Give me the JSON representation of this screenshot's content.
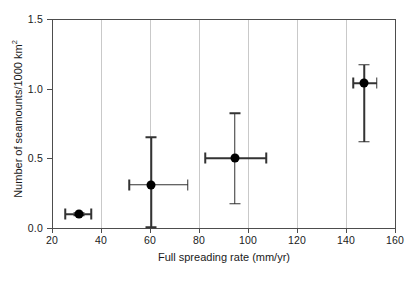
{
  "chart_data": {
    "type": "scatter",
    "title": "",
    "xlabel": "Full spreading rate (mm/yr)",
    "ylabel": "Number of seamounts/1000 km",
    "ylabel_superscript": "2",
    "xlim": [
      20,
      160
    ],
    "ylim": [
      0.0,
      1.5
    ],
    "xticks": [
      20,
      40,
      60,
      80,
      100,
      120,
      140,
      160
    ],
    "xticklabels": [
      "20",
      "40",
      "60",
      "80",
      "100",
      "120",
      "140",
      "160"
    ],
    "yticks": [
      0.0,
      0.5,
      1.0,
      1.5
    ],
    "yticklabels": [
      "0.0",
      "0.5",
      "1.0",
      "1.5"
    ],
    "grid": "vertical",
    "grid_color": "#c9c9c9",
    "marker_color": "#000000",
    "errorbar_color": "#333333",
    "axis_color": "#4d4d4d",
    "legend": "none",
    "points": [
      {
        "label": "point-1",
        "x": 31.0,
        "y": 0.1,
        "xerr_low": 25.5,
        "xerr_high": 36.0,
        "yerr_low": 0.09,
        "yerr_high": 0.11
      },
      {
        "label": "point-2",
        "x": 60.5,
        "y": 0.31,
        "xerr_low": 51.5,
        "xerr_high": 75.5,
        "yerr_low": 0.005,
        "yerr_high": 0.65
      },
      {
        "label": "point-3",
        "x": 94.5,
        "y": 0.5,
        "xerr_low": 82.5,
        "xerr_high": 107.5,
        "yerr_low": 0.175,
        "yerr_high": 0.825
      },
      {
        "label": "point-4",
        "x": 147.5,
        "y": 1.04,
        "xerr_low": 143.0,
        "xerr_high": 152.5,
        "yerr_low": 0.62,
        "yerr_high": 1.17
      }
    ]
  },
  "caption": {
    "partial_text": ""
  }
}
